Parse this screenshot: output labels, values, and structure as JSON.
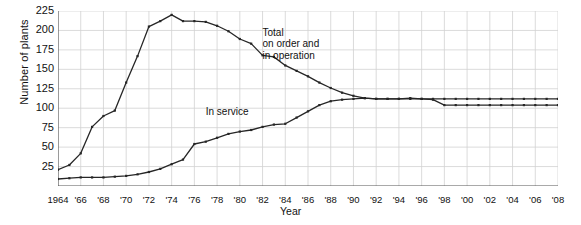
{
  "chart_data": {
    "type": "line",
    "title": "",
    "xlabel": "Year",
    "ylabel": "Number of plants",
    "xlim": [
      1964,
      2008
    ],
    "ylim": [
      0,
      225
    ],
    "grid": true,
    "legend_position": "inline-annotations",
    "y_ticks": [
      225,
      200,
      175,
      150,
      125,
      100,
      75,
      50,
      25
    ],
    "x_ticks": [
      "1964",
      "'66",
      "'68",
      "'70",
      "'72",
      "'74",
      "'76",
      "'78",
      "'80",
      "'82",
      "'84",
      "'86",
      "'88",
      "'90",
      "'92",
      "'94",
      "'96",
      "'98",
      "'00",
      "'02",
      "'04",
      "'06",
      "'08"
    ],
    "x_tick_years": [
      1964,
      1966,
      1968,
      1970,
      1972,
      1974,
      1976,
      1978,
      1980,
      1982,
      1984,
      1986,
      1988,
      1990,
      1992,
      1994,
      1996,
      1998,
      2000,
      2002,
      2004,
      2006,
      2008
    ],
    "annotations": [
      {
        "name": "total-label",
        "text": [
          "Total",
          "on order and",
          "in operation"
        ],
        "x": 1982,
        "y": 205
      },
      {
        "name": "in-service-label",
        "text": [
          "In service"
        ],
        "x": 1977,
        "y": 103
      }
    ],
    "x": [
      1964,
      1965,
      1966,
      1967,
      1968,
      1969,
      1970,
      1971,
      1972,
      1973,
      1974,
      1975,
      1976,
      1977,
      1978,
      1979,
      1980,
      1981,
      1982,
      1983,
      1984,
      1985,
      1986,
      1987,
      1988,
      1989,
      1990,
      1991,
      1992,
      1993,
      1994,
      1995,
      1996,
      1997,
      1998,
      1999,
      2000,
      2001,
      2002,
      2003,
      2004,
      2005,
      2006,
      2007,
      2008
    ],
    "series": [
      {
        "name": "Total on order and in operation",
        "color": "#262626",
        "values": [
          21,
          27,
          42,
          76,
          90,
          97,
          133,
          167,
          205,
          212,
          220,
          212,
          212,
          211,
          206,
          199,
          189,
          183,
          168,
          166,
          155,
          148,
          141,
          133,
          126,
          120,
          116,
          113,
          112,
          112,
          112,
          112,
          112,
          112,
          112,
          112,
          112,
          112,
          112,
          112,
          112,
          112,
          112,
          112,
          112
        ]
      },
      {
        "name": "In service",
        "color": "#262626",
        "values": [
          9,
          10,
          11,
          11,
          11,
          12,
          13,
          15,
          18,
          22,
          28,
          34,
          54,
          57,
          62,
          67,
          70,
          72,
          76,
          79,
          80,
          88,
          96,
          104,
          109,
          111,
          112,
          113,
          112,
          112,
          112,
          113,
          112,
          111,
          104,
          104,
          104,
          104,
          104,
          104,
          104,
          104,
          104,
          104,
          104
        ]
      }
    ]
  }
}
